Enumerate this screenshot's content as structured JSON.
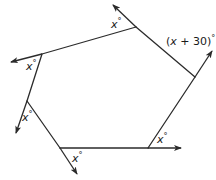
{
  "diagram": {
    "stroke_color": "#2b2b2b",
    "vertices": [
      {
        "id": "top",
        "x": 136,
        "y": 27
      },
      {
        "id": "right",
        "x": 195,
        "y": 77
      },
      {
        "id": "bottom-right",
        "x": 148,
        "y": 148
      },
      {
        "id": "bottom-left",
        "x": 60,
        "y": 148
      },
      {
        "id": "left-bottom",
        "x": 27,
        "y": 101
      },
      {
        "id": "left-top",
        "x": 42,
        "y": 54
      }
    ],
    "rays": [
      {
        "from": "top",
        "tip": {
          "x": 113,
          "y": 5
        }
      },
      {
        "from": "right",
        "tip": {
          "x": 212,
          "y": 51
        }
      },
      {
        "from": "bottom-right",
        "tip": {
          "x": 181,
          "y": 148
        }
      },
      {
        "from": "bottom-left",
        "tip": {
          "x": 77,
          "y": 174
        }
      },
      {
        "from": "left-bottom",
        "tip": {
          "x": 16,
          "y": 133
        }
      },
      {
        "from": "left-top",
        "tip": {
          "x": 11,
          "y": 62
        }
      }
    ],
    "labels": [
      {
        "id": "angle-top",
        "var": "x",
        "suffix": "°",
        "x": 111,
        "y": 19
      },
      {
        "id": "angle-right",
        "text": "(x + 30)°",
        "prefix": "(",
        "var": "x",
        "rest": " + 30)",
        "suffix": "°",
        "x": 166,
        "y": 36
      },
      {
        "id": "angle-left-top",
        "var": "x",
        "suffix": "°",
        "x": 26,
        "y": 61
      },
      {
        "id": "angle-left-bottom",
        "var": "x",
        "suffix": "°",
        "x": 22,
        "y": 112
      },
      {
        "id": "angle-bottom-left",
        "var": "x",
        "suffix": "°",
        "x": 72,
        "y": 153
      },
      {
        "id": "angle-bottom-right",
        "var": "x",
        "suffix": "°",
        "x": 157,
        "y": 134
      }
    ]
  }
}
